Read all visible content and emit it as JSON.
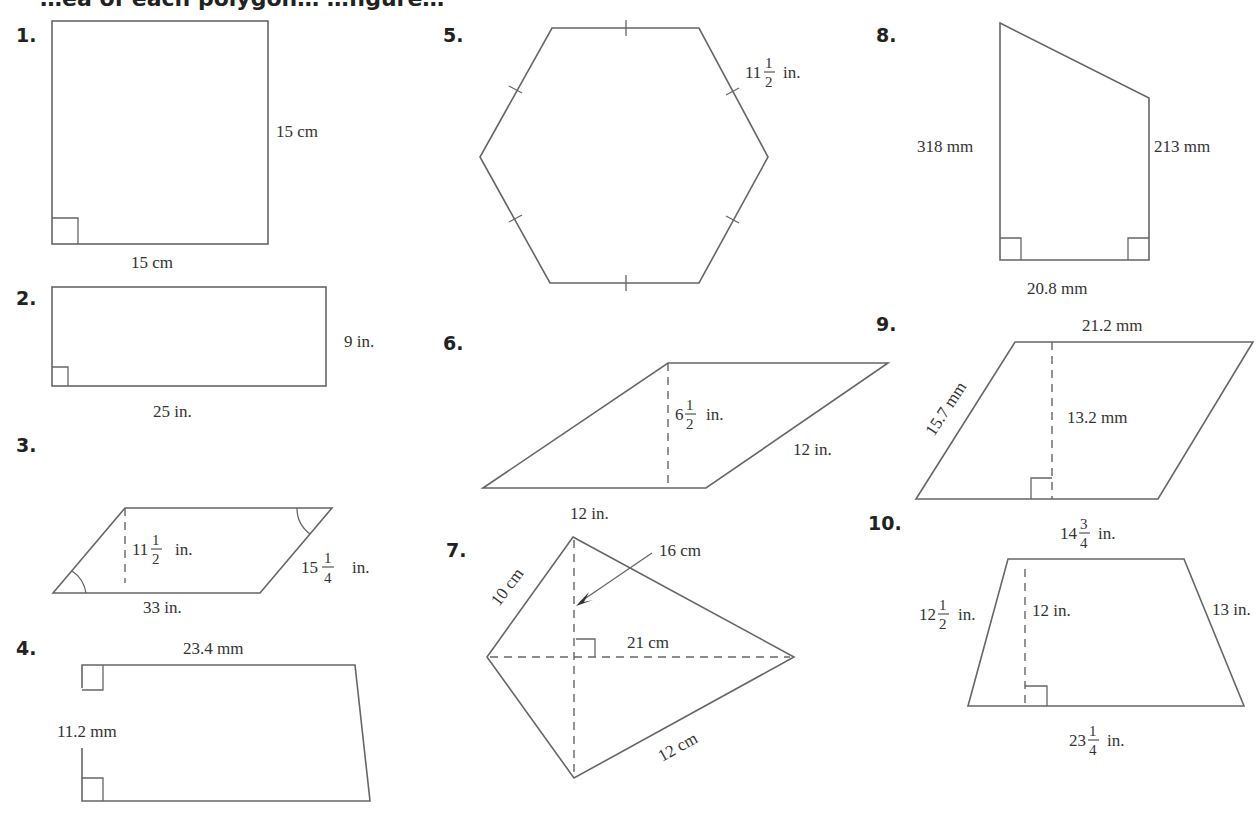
{
  "page": {
    "heading_partial": "…ea of each polygon… …figure…"
  },
  "problems": [
    {
      "number": "1.",
      "shape": "square",
      "labels": {
        "side": "15 cm",
        "base": "15 cm"
      }
    },
    {
      "number": "2.",
      "shape": "rectangle",
      "labels": {
        "height": "9 in.",
        "base": "25 in."
      }
    },
    {
      "number": "3.",
      "shape": "parallelogram",
      "labels": {
        "height_whole": "11",
        "height_num": "1",
        "height_den": "2",
        "height_unit": "in.",
        "side_whole": "15",
        "side_num": "1",
        "side_den": "4",
        "side_unit": "in.",
        "base": "33 in."
      }
    },
    {
      "number": "4.",
      "shape": "trapezoid",
      "labels": {
        "top": "23.4 mm",
        "height": "11.2 mm"
      }
    },
    {
      "number": "5.",
      "shape": "regular hexagon",
      "labels": {
        "side_whole": "11",
        "side_num": "1",
        "side_den": "2",
        "side_unit": "in."
      }
    },
    {
      "number": "6.",
      "shape": "parallelogram",
      "labels": {
        "height_whole": "6",
        "height_num": "1",
        "height_den": "2",
        "height_unit": "in.",
        "side": "12 in.",
        "base": "12 in."
      }
    },
    {
      "number": "7.",
      "shape": "kite",
      "labels": {
        "upper_left": "10 cm",
        "vertical_diagonal": "16 cm",
        "horizontal_diagonal": "21 cm",
        "lower_right": "12 cm"
      }
    },
    {
      "number": "8.",
      "shape": "trapezoid",
      "labels": {
        "left": "318 mm",
        "right": "213 mm",
        "base": "20.8 mm"
      }
    },
    {
      "number": "9.",
      "shape": "parallelogram",
      "labels": {
        "top": "21.2 mm",
        "side": "15.7 mm",
        "height": "13.2 mm"
      }
    },
    {
      "number": "10.",
      "shape": "trapezoid",
      "labels": {
        "top_whole": "14",
        "top_num": "3",
        "top_den": "4",
        "top_unit": "in.",
        "left_whole": "12",
        "left_num": "1",
        "left_den": "2",
        "left_unit": "in.",
        "height": "12 in.",
        "right": "13 in.",
        "bottom_whole": "23",
        "bottom_num": "1",
        "bottom_den": "4",
        "bottom_unit": "in."
      }
    }
  ]
}
